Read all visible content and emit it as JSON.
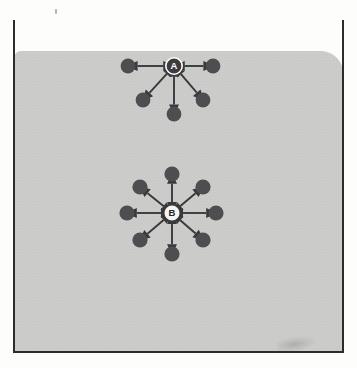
{
  "figure": {
    "background_color": "#cfcfcd",
    "page_color": "#fdfdfc",
    "frame_color": "#2c2c2c",
    "dot_color": "#4e4e50",
    "arrow_color": "#39393b"
  },
  "clusters": [
    {
      "id": "cluster-a",
      "label": "A",
      "label_style": "dark-fill-white-letter",
      "center": {
        "x": 174,
        "y": 66
      },
      "hub_radius": 8.2,
      "satellite_radius": 7.4,
      "satellite_count": 5,
      "satellites": [
        {
          "name": "a-dot-left",
          "x": 128,
          "y": 66
        },
        {
          "name": "a-dot-right",
          "x": 213,
          "y": 66
        },
        {
          "name": "a-dot-lower-left",
          "x": 143,
          "y": 100
        },
        {
          "name": "a-dot-lower-right",
          "x": 203,
          "y": 100
        },
        {
          "name": "a-dot-bottom",
          "x": 174,
          "y": 114
        }
      ]
    },
    {
      "id": "cluster-b",
      "label": "B",
      "label_style": "light-fill-dark-letter",
      "center": {
        "x": 172,
        "y": 213
      },
      "hub_radius": 8.4,
      "satellite_radius": 7.6,
      "satellite_count": 8,
      "satellites": [
        {
          "name": "b-dot-top",
          "x": 172,
          "y": 174
        },
        {
          "name": "b-dot-top-right",
          "x": 203,
          "y": 187
        },
        {
          "name": "b-dot-right",
          "x": 216,
          "y": 213
        },
        {
          "name": "b-dot-bottom-right",
          "x": 203,
          "y": 240
        },
        {
          "name": "b-dot-bottom",
          "x": 172,
          "y": 254
        },
        {
          "name": "b-dot-bottom-left",
          "x": 140,
          "y": 240
        },
        {
          "name": "b-dot-left",
          "x": 127,
          "y": 213
        },
        {
          "name": "b-dot-top-left",
          "x": 140,
          "y": 187
        }
      ]
    }
  ],
  "artifacts": {
    "stain_label": "paper-stain",
    "speck_label": "scan-speck"
  }
}
